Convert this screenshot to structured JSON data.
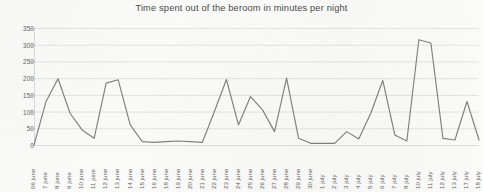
{
  "chart_data": {
    "type": "line",
    "title": "Time spent out of the beroom in minutes per night",
    "xlabel": "",
    "ylabel": "",
    "ylim": [
      0,
      350
    ],
    "ytick_step": 50,
    "yticks": [
      0,
      50,
      100,
      150,
      200,
      250,
      300,
      350
    ],
    "grid": true,
    "legend": "none",
    "line_color": "#808080",
    "grid_color": "#d9d9d9",
    "background_color": "#fbfbf9",
    "title_color": "#4a4a4a",
    "tick_label_color": "#636363",
    "categories": [
      "06 june",
      "7 june",
      "8 june",
      "9 june",
      "10 june",
      "11 june",
      "12 june",
      "13 june",
      "14 june",
      "15 june",
      "16 june",
      "18 june",
      "19 june",
      "20 june",
      "21 june",
      "22 june",
      "23 june",
      "24 june",
      "25 june",
      "26 june",
      "27 june",
      "28 june",
      "29 june",
      "30 june",
      "1 july",
      "2 july",
      "3 july",
      "4 july",
      "5 july",
      "6 july",
      "7 july",
      "8 july",
      "10 july",
      "11 july",
      "12 july",
      "13 july",
      "17 july",
      "18 july"
    ],
    "values": [
      0,
      130,
      198,
      95,
      45,
      20,
      185,
      195,
      60,
      10,
      8,
      10,
      12,
      10,
      8,
      100,
      196,
      60,
      145,
      105,
      40,
      200,
      20,
      5,
      5,
      5,
      40,
      18,
      95,
      193,
      30,
      12,
      315,
      305,
      20,
      15,
      130,
      15
    ]
  }
}
